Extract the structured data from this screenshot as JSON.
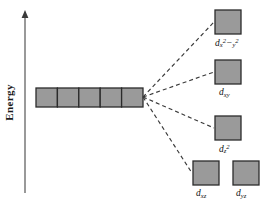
{
  "figure": {
    "type": "crystal-field-splitting-diagram",
    "background_color": "#ffffff",
    "box_fill_color": "#9a9a9a",
    "box_stroke_color": "#2b2b2b",
    "dashed_line_color": "#3a3a3a",
    "axis_color": "#6e6e6e",
    "text_color": "#111111"
  },
  "axis": {
    "label": "Energy",
    "direction": "up",
    "x": 25,
    "y_top": 12,
    "y_bottom": 193,
    "arrow": "up-arrow-icon"
  },
  "degenerate_set": {
    "count": 5,
    "x": 36,
    "y": 88,
    "box_width": 21.4,
    "box_height": 19,
    "boxes": [
      {
        "index": 1
      },
      {
        "index": 2
      },
      {
        "index": 3
      },
      {
        "index": 4
      },
      {
        "index": 5
      }
    ]
  },
  "split_origin": {
    "x": 143,
    "y": 97
  },
  "split_levels": [
    {
      "id": "dx2-y2",
      "label_html": "d<sub>x</sub><sup>2</sup>−<sub>y</sub><sup>2</sup>",
      "label_plain": "d x2-y2",
      "box": {
        "x": 215,
        "y": 10,
        "w": 26,
        "h": 24
      },
      "label_pos": {
        "x": 215,
        "y": 38
      },
      "has_connector": true
    },
    {
      "id": "dxy",
      "label_html": "d<sub>xy</sub>",
      "label_plain": "d xy",
      "box": {
        "x": 215,
        "y": 60,
        "w": 26,
        "h": 24
      },
      "label_pos": {
        "x": 219,
        "y": 88
      },
      "has_connector": true
    },
    {
      "id": "dz2",
      "label_html": "d<sub>z</sub><sup>2</sup>",
      "label_plain": "d z2",
      "box": {
        "x": 215,
        "y": 116,
        "w": 26,
        "h": 24
      },
      "label_pos": {
        "x": 219,
        "y": 144
      },
      "has_connector": true
    },
    {
      "id": "dxz",
      "label_html": "d<sub>xz</sub>",
      "label_plain": "d xz",
      "box": {
        "x": 193,
        "y": 161,
        "w": 26,
        "h": 24
      },
      "label_pos": {
        "x": 196,
        "y": 189
      },
      "has_connector": true
    },
    {
      "id": "dyz",
      "label_html": "d<sub>yz</sub>",
      "label_plain": "d yz",
      "box": {
        "x": 233,
        "y": 161,
        "w": 26,
        "h": 24
      },
      "label_pos": {
        "x": 236,
        "y": 189
      },
      "has_connector": false
    }
  ]
}
